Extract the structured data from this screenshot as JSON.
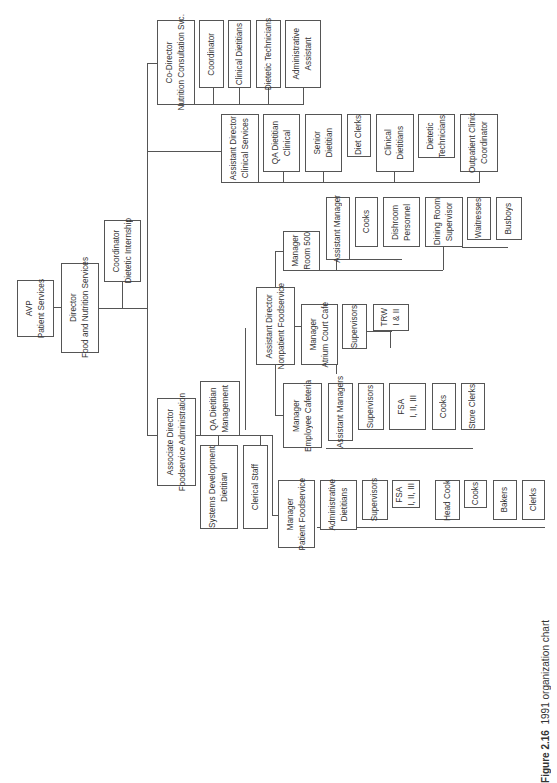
{
  "caption": {
    "figure": "Figure 2.16",
    "text": "1991 organization chart"
  },
  "nodes": {
    "avp": "AVP\nPatient Services",
    "director": "Director\nFood and Nutrition Services",
    "coord_intern": "Coordinator\nDietetic Internship",
    "codir": "Co-Director\nNutrition Consultation Svc.",
    "ncs_coord": "Coordinator",
    "ncs_clin": "Clinical Dietitians",
    "ncs_tech": "Dietetic Technicians",
    "ncs_admin": "Administrative\nAssistant",
    "ad_clin": "Assistant Director\nClinical Services",
    "qa_clin": "QA Dietitian\nClinical",
    "senior": "Senior\nDietitian",
    "diet_clerks": "Diet Clerks",
    "cs_clin": "Clinical\nDietitians",
    "cs_tech": "Dietetic\nTechnicians",
    "outpatient": "Outpatient Clinic\nCoordinator",
    "mgr500": "Manager\nRoom 500",
    "r500_asst": "Assistant Manager",
    "r500_cooks": "Cooks",
    "r500_dish": "Dishroom\nPersonnel",
    "r500_dining": "Dining Room\nSupervisor",
    "r500_wait": "Waitresses",
    "r500_bus": "Busboys",
    "ad_nonpat": "Assistant Director\nNonpatient Foodservice",
    "mgr_atrium": "Manager\nAtrium Court Cafe",
    "atr_sup": "Supervisors",
    "atr_trw": "TRW\nI & II",
    "mgr_emp": "Manager\nEmployee Cafeteria",
    "emp_asst": "Assistant Managers",
    "emp_sup": "Supervisors",
    "emp_fsa": "FSA\nI, II, III",
    "emp_cooks": "Cooks",
    "emp_store": "Store Clerks",
    "assoc": "Associate Director\nFoodservice Administration",
    "qa_mgmt": "QA Dietitian\nManagement",
    "sysdev": "Systems Development\nDietitian",
    "clerical": "Clerical Staff",
    "mgr_pat": "Manager\nPatient Foodservice",
    "pat_admin": "Administrative\nDietitians",
    "pat_sup": "Supervisors",
    "pat_fsa": "FSA\nI, II, III",
    "pat_head": "Head Cook",
    "pat_cooks": "Cooks",
    "pat_bakers": "Bakers",
    "pat_clerks": "Clerks"
  }
}
